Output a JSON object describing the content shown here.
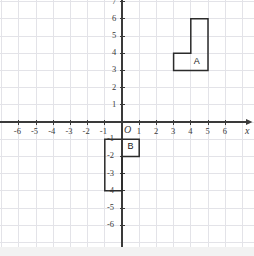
{
  "figure": {
    "kind": "coordinate-plane",
    "background_color": "#ffffff",
    "grid_color": "#e3e3e8",
    "axis_color": "#3a3a3a",
    "shape_stroke_color": "#2b2b2b",
    "origin_label": "O",
    "x_axis_label": "x",
    "y_axis_label": ""
  },
  "axes": {
    "x_ticks": [
      "-6",
      "-5",
      "-4",
      "-3",
      "-2",
      "-1",
      "1",
      "2",
      "3",
      "4",
      "5",
      "6"
    ],
    "x_tick_values": [
      -6,
      -5,
      -4,
      -3,
      -2,
      -1,
      1,
      2,
      3,
      4,
      5,
      6
    ],
    "y_ticks": [
      "6",
      "5",
      "4",
      "3",
      "2",
      "1",
      "-1",
      "-2",
      "-3",
      "-4",
      "-5",
      "-6"
    ],
    "y_tick_values": [
      6,
      5,
      4,
      3,
      2,
      1,
      -1,
      -2,
      -3,
      -4,
      -5,
      -6
    ],
    "xlim": [
      -7.1,
      7.6
    ],
    "ylim": [
      -7.0,
      7.4
    ],
    "grid": true,
    "grid_step": 1
  },
  "chart_data": {
    "type": "scatter",
    "title": "",
    "xlabel": "x",
    "ylabel": "",
    "xlim": [
      -7.1,
      7.6
    ],
    "ylim": [
      -7.0,
      7.4
    ],
    "grid": true,
    "shapes": [
      {
        "name": "A",
        "label": "A",
        "label_position": [
          4.35,
          3.42
        ],
        "vertices": [
          [
            3,
            3
          ],
          [
            5,
            3
          ],
          [
            5,
            6
          ],
          [
            4,
            6
          ],
          [
            4,
            4
          ],
          [
            3,
            4
          ]
        ]
      },
      {
        "name": "B",
        "label": "B",
        "label_position": [
          0.5,
          -1.5
        ],
        "vertices": [
          [
            -1,
            -1
          ],
          [
            1,
            -1
          ],
          [
            1,
            -2
          ],
          [
            0,
            -2
          ],
          [
            0,
            -4
          ],
          [
            -1,
            -4
          ]
        ]
      }
    ]
  }
}
